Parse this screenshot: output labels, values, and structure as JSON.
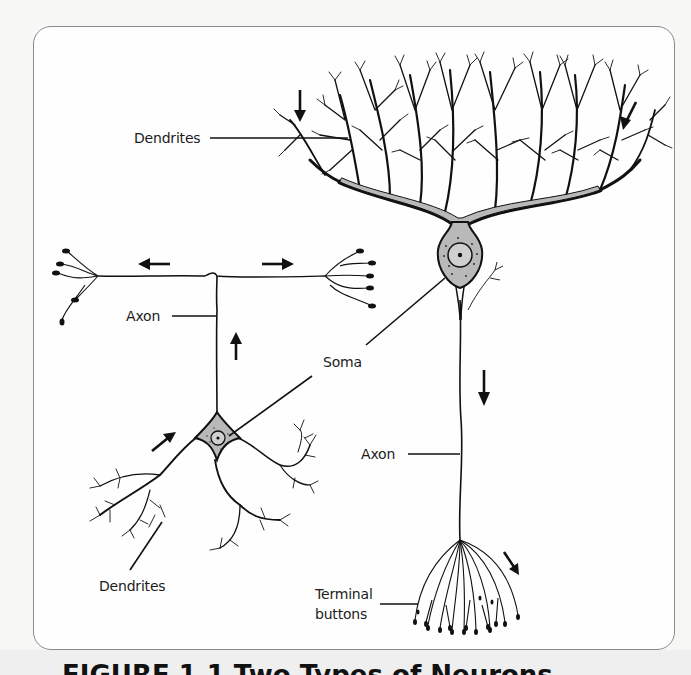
{
  "figure": {
    "caption_partial": "FIGURE 1.1   Two Types of Neurons",
    "frame_border_color": "#8a8a8a",
    "line_color": "#111111",
    "soma_fill": "#b9b9b9"
  },
  "labels": {
    "right_dendrites": "Dendrites",
    "left_axon": "Axon",
    "soma": "Soma",
    "right_axon": "Axon",
    "left_dendrites": "Dendrites",
    "terminal_buttons_line1": "Terminal",
    "terminal_buttons_line2": "buttons"
  },
  "arrows": [
    {
      "name": "dendrite-input-arrow-left",
      "direction": "down"
    },
    {
      "name": "dendrite-input-arrow-right",
      "direction": "down-left"
    },
    {
      "name": "axon-left-branch-arrow",
      "direction": "left"
    },
    {
      "name": "axon-right-branch-arrow",
      "direction": "right"
    },
    {
      "name": "left-axon-up-arrow",
      "direction": "up"
    },
    {
      "name": "right-axon-down-arrow",
      "direction": "down"
    },
    {
      "name": "left-dendrite-arrow",
      "direction": "up-right"
    },
    {
      "name": "terminal-arrow",
      "direction": "down-right"
    }
  ],
  "neurons": [
    {
      "name": "multipolar-neuron",
      "position": "left"
    },
    {
      "name": "pyramidal-purkinje-neuron",
      "position": "right"
    }
  ]
}
